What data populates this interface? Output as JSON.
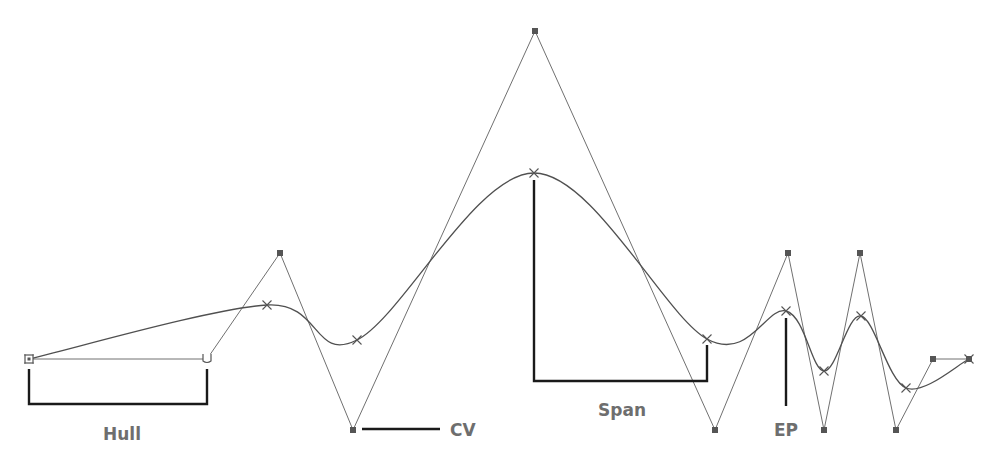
{
  "diagram": {
    "labels": {
      "hull": "Hull",
      "cv": "CV",
      "span": "Span",
      "ep": "EP"
    },
    "colors": {
      "hull_line": "#707070",
      "curve_line": "#505050",
      "control_vertex": "#555555",
      "callout_line": "#1a1a1a",
      "label_text": "#6e6e6e",
      "background": "#ffffff"
    },
    "control_vertices": [
      {
        "id": "cv0",
        "x": 29,
        "y": 359,
        "style": "first"
      },
      {
        "id": "cv1",
        "x": 207,
        "y": 359,
        "style": "second"
      },
      {
        "id": "cv2",
        "x": 280,
        "y": 253,
        "style": "normal"
      },
      {
        "id": "cv3",
        "x": 353,
        "y": 430,
        "style": "normal"
      },
      {
        "id": "cv4",
        "x": 535,
        "y": 31,
        "style": "normal"
      },
      {
        "id": "cv5",
        "x": 715,
        "y": 430,
        "style": "normal"
      },
      {
        "id": "cv6",
        "x": 788,
        "y": 253,
        "style": "normal"
      },
      {
        "id": "cv7",
        "x": 824,
        "y": 430,
        "style": "normal"
      },
      {
        "id": "cv8",
        "x": 860,
        "y": 253,
        "style": "normal"
      },
      {
        "id": "cv9",
        "x": 896,
        "y": 430,
        "style": "normal"
      },
      {
        "id": "cv10",
        "x": 933,
        "y": 359,
        "style": "normal"
      },
      {
        "id": "cv11",
        "x": 969,
        "y": 359,
        "style": "normal"
      }
    ],
    "edit_points": [
      {
        "x": 29,
        "y": 359
      },
      {
        "x": 267,
        "y": 305
      },
      {
        "x": 357,
        "y": 340
      },
      {
        "x": 534,
        "y": 173
      },
      {
        "x": 707,
        "y": 339
      },
      {
        "x": 786,
        "y": 311
      },
      {
        "x": 824,
        "y": 371
      },
      {
        "x": 861,
        "y": 316
      },
      {
        "x": 906,
        "y": 388
      },
      {
        "x": 969,
        "y": 359
      }
    ],
    "callouts": {
      "hull": {
        "from": [
          29,
          369
        ],
        "to": [
          207,
          369
        ],
        "bottom": 404,
        "label_at": [
          122,
          440
        ]
      },
      "cv": {
        "from": [
          362,
          429
        ],
        "to": [
          440,
          429
        ],
        "label_at": [
          450,
          436
        ]
      },
      "span": {
        "from": [
          534,
          180
        ],
        "to": [
          707,
          345
        ],
        "bottom": 381,
        "label_at": [
          622,
          416
        ]
      },
      "ep": {
        "from": [
          786,
          318
        ],
        "to": [
          786,
          406
        ],
        "label_at": [
          786,
          436
        ]
      }
    }
  }
}
